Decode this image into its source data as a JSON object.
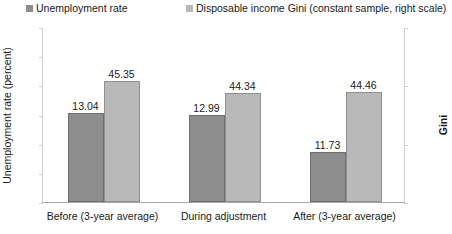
{
  "chart_data": {
    "type": "bar",
    "title": "",
    "categories": [
      "Before (3-year average)",
      "During adjustment",
      "After (3-year average)"
    ],
    "series": [
      {
        "name": "Unemployment rate",
        "axis": "left",
        "color": "#8d8d8d",
        "values": [
          13.04,
          12.99,
          11.73
        ],
        "labels": [
          "13.04",
          "12.99",
          "11.73"
        ]
      },
      {
        "name": "Disposable income Gini (constant sample, right scale)",
        "axis": "right",
        "color": "#b9b9b9",
        "values": [
          45.35,
          44.34,
          44.46
        ],
        "labels": [
          "45.35",
          "44.34",
          "44.46"
        ]
      }
    ],
    "xlabel": "",
    "ylabel": "Unemployment rate (percent)",
    "y2label": "Gini",
    "ylim": [
      10,
      16
    ],
    "y2lim": [
      35,
      50
    ],
    "yticks": [
      "16",
      "15",
      "14",
      "13",
      "12",
      "11",
      "10"
    ],
    "ytick_values": [
      16,
      15,
      14,
      13,
      12,
      11,
      10
    ],
    "y2ticks": [
      "50",
      "45",
      "40",
      "35"
    ],
    "y2tick_values": [
      50,
      45,
      40,
      35
    ],
    "grid": false,
    "legend_position": "top"
  },
  "legend": {
    "entries": [
      {
        "label": "Unemployment rate",
        "color": "#8d8d8d"
      },
      {
        "label": "Disposable income Gini (constant sample, right scale)",
        "color": "#b9b9b9"
      }
    ]
  },
  "axes": {
    "left_title": "Unemployment rate (percent)",
    "right_title": "Gini"
  },
  "colors": {
    "series_unemployment": "#8d8d8d",
    "series_gini": "#b9b9b9",
    "axis_line": "#a8a8a8",
    "text": "#1a1a1a",
    "background": "#ffffff"
  }
}
